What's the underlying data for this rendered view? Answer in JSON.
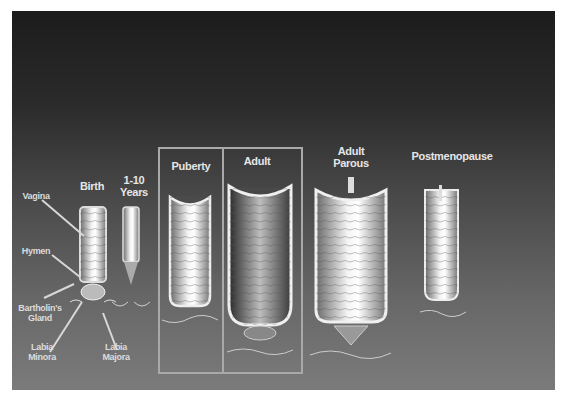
{
  "figure": {
    "stages": [
      {
        "id": "birth",
        "label": "Birth"
      },
      {
        "id": "1-10",
        "label": "1-10 Years"
      },
      {
        "id": "puberty",
        "label": "Puberty"
      },
      {
        "id": "adult",
        "label": "Adult"
      },
      {
        "id": "adult-parous",
        "label": "Adult Parous"
      },
      {
        "id": "postmenopause",
        "label": "Postmenopause"
      }
    ],
    "stage_lines": {
      "birth": "Birth",
      "years_1": "1-10",
      "years_2": "Years",
      "puberty": "Puberty",
      "adult": "Adult",
      "parous_1": "Adult",
      "parous_2": "Parous",
      "postmenopause": "Postmenopause"
    },
    "anatomy_labels": {
      "vagina": "Vagina",
      "hymen": "Hymen",
      "bartholin_1": "Bartholin's",
      "bartholin_2": "Gland",
      "labia_minora_1": "Labia",
      "labia_minora_2": "Minora",
      "labia_majora_1": "Labia",
      "labia_majora_2": "Majora"
    },
    "colors": {
      "background_top": "#1c1c1c",
      "background_bottom": "#7b7b7b",
      "label": "#e6e6e6",
      "highlight_box": "#a9a9a9"
    }
  }
}
